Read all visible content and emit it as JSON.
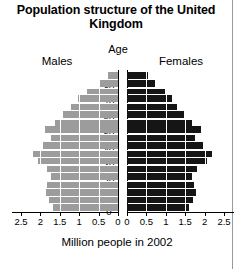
{
  "title": "Population structure of the United Kingdom",
  "labels": {
    "age": "Age",
    "males": "Males",
    "females": "Females",
    "axis_caption": "Million people in 2002"
  },
  "colors": {
    "male_bar": "#9c9c9c",
    "female_bar": "#151515",
    "background": "#ffffff",
    "gridline": "#ffffff",
    "axis": "#000000"
  },
  "chart_data": {
    "type": "bar",
    "subtype": "population-pyramid",
    "title": "Population structure of the United Kingdom",
    "xlabel": "Million people in 2002",
    "ylabel": "Age",
    "grid": true,
    "legend_position": "top",
    "xlim_left": [
      2.5,
      0
    ],
    "xlim_right": [
      0,
      2.5
    ],
    "ylim": [
      0,
      90
    ],
    "x_tick_labels_left": [
      "2.5",
      "2",
      "1.5",
      "1",
      "0.5",
      "0"
    ],
    "x_tick_labels_right": [
      "0",
      "0.5",
      "1",
      "1.5",
      "2",
      "2.5"
    ],
    "x_tick_values": [
      2.5,
      2.0,
      1.5,
      1.0,
      0.5,
      0.0
    ],
    "y_tick_labels": [
      "0",
      "10",
      "20",
      "30",
      "40",
      "50",
      "60",
      "70",
      "80"
    ],
    "y_tick_values": [
      0,
      10,
      20,
      30,
      40,
      50,
      60,
      70,
      80
    ],
    "categories": [
      "0-4",
      "5-9",
      "10-14",
      "15-19",
      "20-24",
      "25-29",
      "30-34",
      "35-39",
      "40-44",
      "45-49",
      "50-54",
      "55-59",
      "60-64",
      "65-69",
      "70-74",
      "75-79",
      "80-84",
      "85+"
    ],
    "series": [
      {
        "name": "Males",
        "color": "#9c9c9c",
        "side": "left",
        "values": [
          1.68,
          1.78,
          1.86,
          1.82,
          1.72,
          1.82,
          2.07,
          2.18,
          1.93,
          1.72,
          1.88,
          1.63,
          1.42,
          1.2,
          1.04,
          0.79,
          0.49,
          0.26
        ]
      },
      {
        "name": "Females",
        "color": "#151515",
        "side": "right",
        "values": [
          1.6,
          1.7,
          1.77,
          1.73,
          1.68,
          1.81,
          2.07,
          2.18,
          1.95,
          1.75,
          1.91,
          1.67,
          1.47,
          1.28,
          1.17,
          0.98,
          0.72,
          0.54
        ]
      }
    ]
  }
}
